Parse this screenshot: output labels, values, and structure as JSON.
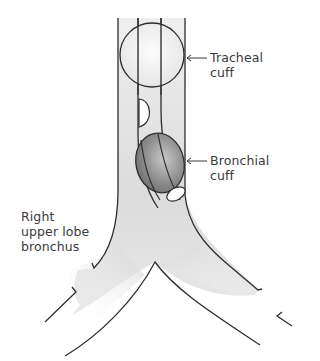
{
  "diagram": {
    "type": "anatomical-illustration",
    "labels": {
      "tracheal_cuff": {
        "line1": "Tracheal",
        "line2": "cuff"
      },
      "bronchial_cuff": {
        "line1": "Bronchial",
        "line2": "cuff"
      },
      "right_upper_lobe": {
        "line1": "Right",
        "line2": "upper lobe",
        "line3": "bronchus"
      }
    },
    "colors": {
      "outline": "#2e2e2e",
      "airway_fill": "#e2e2e2",
      "tracheal_cuff_fill": "#f2f2f2",
      "bronchial_cuff_fill": "#8a8a8a",
      "text": "#3a3a3a"
    }
  }
}
